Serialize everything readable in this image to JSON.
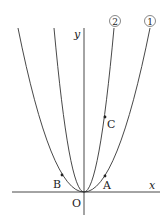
{
  "diagram": {
    "axes": {
      "x_label": "x",
      "y_label": "y",
      "origin_label": "O"
    },
    "curves": [
      {
        "id": "curve-1",
        "label": "①",
        "description": "wider parabola y = a x^2"
      },
      {
        "id": "curve-2",
        "label": "②",
        "description": "narrower parabola y = b x^2"
      }
    ],
    "points": [
      {
        "label": "A",
        "on": "curve-1",
        "side": "right"
      },
      {
        "label": "B",
        "on": "curve-1",
        "side": "left"
      },
      {
        "label": "C",
        "on": "curve-2",
        "side": "right"
      }
    ],
    "colors": {
      "stroke": "#333333",
      "background": "#ffffff"
    }
  }
}
